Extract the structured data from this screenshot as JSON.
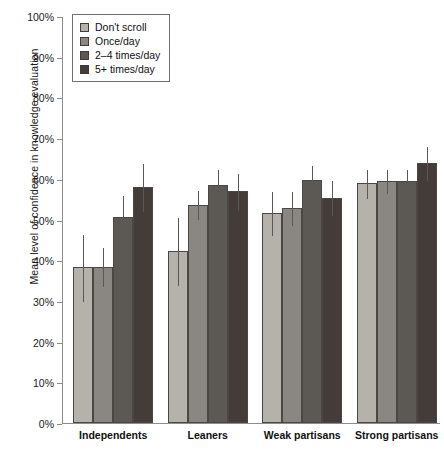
{
  "chart_data": {
    "type": "bar",
    "title": "",
    "xlabel": "",
    "ylabel": "Mean level of confidence in knowledge evaluation",
    "ylim": [
      0,
      100
    ],
    "ytick_labels": [
      "100%",
      "90%",
      "80%",
      "70%",
      "60%",
      "50%",
      "40%",
      "30%",
      "20%",
      "10%",
      "0%"
    ],
    "ytick_values": [
      100,
      90,
      80,
      70,
      60,
      50,
      40,
      30,
      20,
      10,
      0
    ],
    "grid": false,
    "legend_position": "top-left",
    "categories": [
      "Independents",
      "Leaners",
      "Weak partisans",
      "Strong partisans"
    ],
    "series": [
      {
        "name": "Don't scroll",
        "color": "#b5b2ab",
        "values": [
          38.3,
          42.2,
          51.5,
          58.9
        ],
        "err_low": [
          30.0,
          34.0,
          46.2,
          55.3
        ],
        "err_high": [
          46.4,
          50.6,
          57.0,
          62.5
        ]
      },
      {
        "name": "Once/day",
        "color": "#8a8782",
        "values": [
          38.4,
          53.6,
          52.8,
          59.4
        ],
        "err_low": [
          33.6,
          50.0,
          48.7,
          56.4
        ],
        "err_high": [
          43.2,
          57.3,
          57.0,
          62.4
        ]
      },
      {
        "name": "2–4 times/day",
        "color": "#5c5853",
        "values": [
          50.6,
          58.4,
          59.8,
          59.4
        ],
        "err_low": [
          45.2,
          54.4,
          56.1,
          56.4
        ],
        "err_high": [
          56.0,
          62.4,
          63.5,
          62.4
        ]
      },
      {
        "name": "5+ times/day",
        "color": "#433c38",
        "values": [
          58.0,
          56.9,
          55.3,
          63.8
        ],
        "err_low": [
          52.2,
          52.3,
          51.0,
          59.6
        ],
        "err_high": [
          63.8,
          61.5,
          59.6,
          68.0
        ]
      }
    ]
  },
  "axis": {
    "ylabel": "Mean level of confidence in knowledge evaluation"
  },
  "legend": {
    "items": [
      {
        "label": "Don't scroll"
      },
      {
        "label": "Once/day"
      },
      {
        "label": "2–4 times/day"
      },
      {
        "label": "5+ times/day"
      }
    ]
  }
}
